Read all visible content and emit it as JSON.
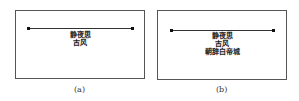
{
  "panels": [
    {
      "caption": "(a)",
      "lines": [
        "静夜思",
        "古风"
      ]
    },
    {
      "caption": "(b)",
      "lines": [
        "静夜思",
        "古风",
        "朝辞白帝城"
      ]
    }
  ]
}
